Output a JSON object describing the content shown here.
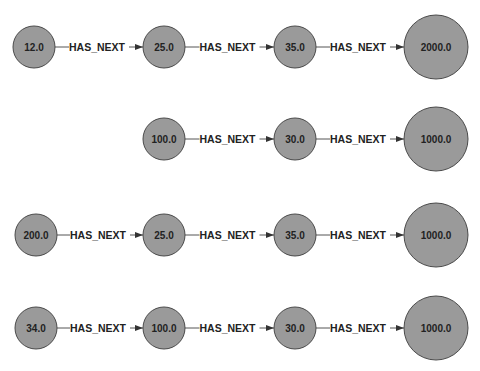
{
  "colors": {
    "background": "#ffffff",
    "node_fill": "#9a9a9a",
    "node_stroke": "#4a4a4a",
    "edge": "#555555",
    "text": "#222222"
  },
  "chains": [
    {
      "y": 47,
      "nodes": [
        {
          "label": "12.0",
          "x": 34,
          "r": 21
        },
        {
          "label": "25.0",
          "x": 164,
          "r": 21
        },
        {
          "label": "35.0",
          "x": 295,
          "r": 21
        },
        {
          "label": "2000.0",
          "x": 436,
          "r": 32
        }
      ],
      "edges": [
        {
          "label": "HAS_NEXT"
        },
        {
          "label": "HAS_NEXT"
        },
        {
          "label": "HAS_NEXT"
        }
      ]
    },
    {
      "y": 139,
      "nodes": [
        {
          "label": "100.0",
          "x": 164,
          "r": 21
        },
        {
          "label": "30.0",
          "x": 295,
          "r": 21
        },
        {
          "label": "1000.0",
          "x": 436,
          "r": 32
        }
      ],
      "edges": [
        {
          "label": "HAS_NEXT"
        },
        {
          "label": "HAS_NEXT"
        }
      ]
    },
    {
      "y": 235,
      "nodes": [
        {
          "label": "200.0",
          "x": 36,
          "r": 21
        },
        {
          "label": "25.0",
          "x": 164,
          "r": 21
        },
        {
          "label": "35.0",
          "x": 295,
          "r": 21
        },
        {
          "label": "1000.0",
          "x": 436,
          "r": 32
        }
      ],
      "edges": [
        {
          "label": "HAS_NEXT"
        },
        {
          "label": "HAS_NEXT"
        },
        {
          "label": "HAS_NEXT"
        }
      ]
    },
    {
      "y": 328,
      "nodes": [
        {
          "label": "34.0",
          "x": 36,
          "r": 21
        },
        {
          "label": "100.0",
          "x": 164,
          "r": 21
        },
        {
          "label": "30.0",
          "x": 295,
          "r": 21
        },
        {
          "label": "1000.0",
          "x": 436,
          "r": 32
        }
      ],
      "edges": [
        {
          "label": "HAS_NEXT"
        },
        {
          "label": "HAS_NEXT"
        },
        {
          "label": "HAS_NEXT"
        }
      ]
    }
  ]
}
